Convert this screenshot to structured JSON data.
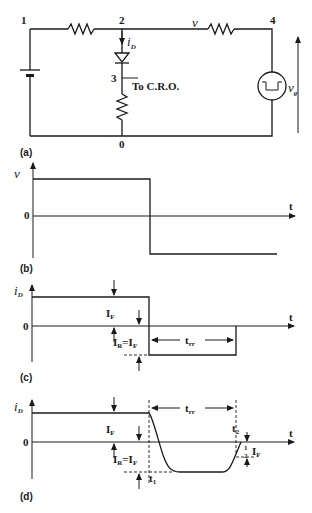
{
  "figure": {
    "panels": [
      {
        "id": "a",
        "caption": "(a)",
        "type": "circuit"
      },
      {
        "id": "b",
        "caption": "(b)",
        "type": "waveform"
      },
      {
        "id": "c",
        "caption": "(c)",
        "type": "waveform"
      },
      {
        "id": "d",
        "caption": "(d)",
        "type": "waveform"
      }
    ]
  },
  "circuit": {
    "nodes": {
      "n1": "1",
      "n2": "2",
      "n3": "3",
      "n4": "4",
      "n0": "0"
    },
    "current_label": "i",
    "current_sub": "D",
    "cro_label": "To  C.R.O.",
    "voltage_label": "v",
    "source_label": "v",
    "source_sub": "g"
  },
  "panel_b": {
    "caption": "(b)",
    "y_label": "v",
    "x_label": "t",
    "zero_label": "0"
  },
  "panel_c": {
    "caption": "(c)",
    "y_label": "i",
    "y_sub": "D",
    "x_label": "t",
    "zero_label": "0",
    "if_label": "I",
    "if_sub": "F",
    "ir_label_a": "I",
    "ir_sub_a": "R",
    "ir_eq": "=I",
    "ir_sub_b": "F",
    "trr_label": "t",
    "trr_sub": "rr"
  },
  "panel_d": {
    "caption": "(d)",
    "y_label": "i",
    "y_sub": "D",
    "x_label": "t",
    "zero_label": "0",
    "if_label": "I",
    "if_sub": "F",
    "ir_label_a": "I",
    "ir_sub_a": "R",
    "ir_eq": "=I",
    "ir_sub_b": "F",
    "trr_label": "t",
    "trr_sub": "rr",
    "t1_label": "t",
    "t1_sub": "1",
    "t2_label": "t",
    "t2_sub": "2",
    "half_num": "1",
    "half_den": "2",
    "half_i": "I",
    "half_sub": "F"
  },
  "colors": {
    "ink": "#1a1a1a",
    "background": "#ffffff"
  }
}
